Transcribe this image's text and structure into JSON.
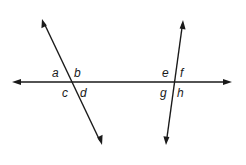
{
  "diagram": {
    "stroke_color": "#1a1a1a",
    "background_color": "#ffffff",
    "lines": [
      {
        "id": "horizontal-line",
        "arrows": "both"
      },
      {
        "id": "left-transversal",
        "arrows": "both"
      },
      {
        "id": "right-transversal",
        "arrows": "both"
      }
    ],
    "labels": {
      "left_intersection": {
        "a": "a",
        "b": "b",
        "c": "c",
        "d": "d"
      },
      "right_intersection": {
        "e": "e",
        "f": "f",
        "g": "g",
        "h": "h"
      }
    }
  }
}
